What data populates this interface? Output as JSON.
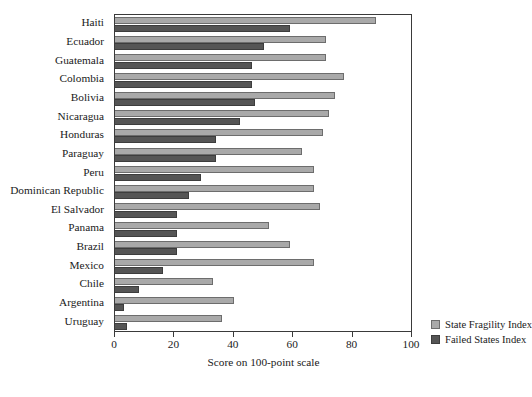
{
  "chart_data": {
    "type": "bar",
    "orientation": "horizontal",
    "title": "",
    "xlabel": "Score on 100-point scale",
    "ylabel": "",
    "xlim": [
      0,
      100
    ],
    "xticks": [
      0,
      20,
      40,
      60,
      80,
      100
    ],
    "grid": false,
    "legend_position": "bottom-right",
    "categories": [
      "Haiti",
      "Ecuador",
      "Guatemala",
      "Colombia",
      "Bolivia",
      "Nicaragua",
      "Honduras",
      "Paraguay",
      "Peru",
      "Dominican Republic",
      "El Salvador",
      "Panama",
      "Brazil",
      "Mexico",
      "Chile",
      "Argentina",
      "Uruguay"
    ],
    "series": [
      {
        "name": "State Fragility Index",
        "color": "#a9a9a9",
        "values": [
          88,
          71,
          71,
          77,
          74,
          72,
          70,
          63,
          67,
          67,
          69,
          52,
          59,
          67,
          33,
          40,
          36
        ]
      },
      {
        "name": "Failed States Index",
        "color": "#555555",
        "values": [
          59,
          50,
          46,
          46,
          47,
          42,
          34,
          34,
          29,
          25,
          21,
          21,
          21,
          16,
          8,
          3,
          4
        ]
      }
    ]
  },
  "axis": {
    "x_title": "Score on 100-point scale",
    "tick_labels": [
      "0",
      "20",
      "40",
      "60",
      "80",
      "100"
    ]
  },
  "legend": {
    "entries": [
      {
        "label": "State Fragility Index",
        "swatch": "light-gray-swatch-icon"
      },
      {
        "label": "Failed States Index",
        "swatch": "dark-gray-swatch-icon"
      }
    ]
  },
  "colors": {
    "series_light": "#a9a9a9",
    "series_dark": "#555555",
    "frame": "#3a3a3a",
    "text": "#1a1a1a",
    "background": "#ffffff"
  }
}
